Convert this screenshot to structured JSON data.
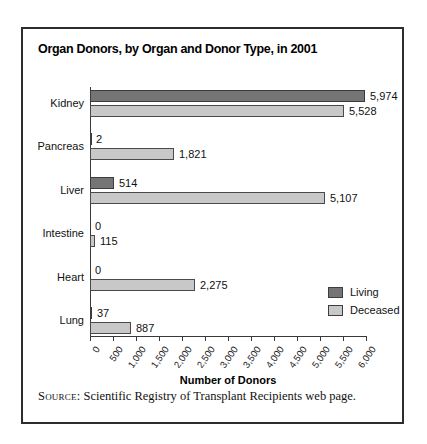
{
  "figure": {
    "title": "Organ Donors, by Organ and Donor Type, in 2001",
    "source_prefix": "Source:",
    "source_text": " Scientific Registry of Transplant Recipients web page."
  },
  "chart_data": {
    "type": "bar",
    "orientation": "horizontal",
    "title": "Organ Donors, by Organ and Donor Type, in 2001",
    "categories": [
      "Kidney",
      "Pancreas",
      "Liver",
      "Intestine",
      "Heart",
      "Lung"
    ],
    "series": [
      {
        "name": "Living",
        "color": "#757575",
        "values": [
          5974,
          2,
          514,
          0,
          0,
          37
        ],
        "value_labels": [
          "5,974",
          "2",
          "514",
          "0",
          "0",
          "37"
        ]
      },
      {
        "name": "Deceased",
        "color": "#c8c8c8",
        "values": [
          5528,
          1821,
          5107,
          115,
          2275,
          887
        ],
        "value_labels": [
          "5,528",
          "1,821",
          "5,107",
          "115",
          "2,275",
          "887"
        ]
      }
    ],
    "xlabel": "Number of Donors",
    "xlim": [
      0,
      6000
    ],
    "xtick_values": [
      0,
      500,
      1000,
      1500,
      2000,
      2500,
      3000,
      3500,
      4000,
      4500,
      5000,
      5500,
      6000
    ],
    "xtick_labels": [
      "0",
      "500",
      "1,000",
      "1,500",
      "2,000",
      "2,500",
      "3,000",
      "3,500",
      "4,000",
      "4,500",
      "5,000",
      "5,500",
      "6,000"
    ],
    "grid": false,
    "legend_position": "inside-right-lower",
    "bar_value_labels_shown": true
  }
}
